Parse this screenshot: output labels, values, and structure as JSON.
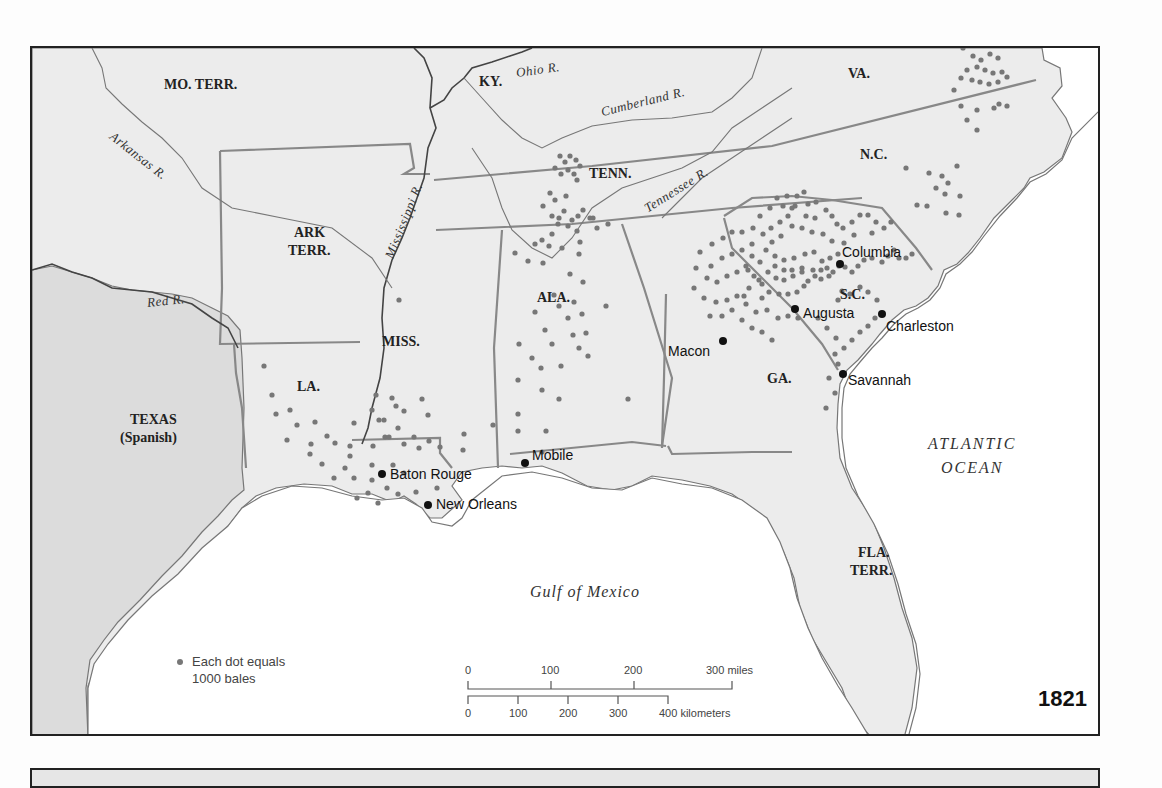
{
  "map": {
    "year": "1821",
    "legend": {
      "symbol": "dot",
      "line1": "Each dot equals",
      "line2": "1000 bales"
    },
    "scale": {
      "miles": {
        "ticks": [
          "0",
          "100",
          "200",
          "300 miles"
        ]
      },
      "kilometers": {
        "ticks": [
          "0",
          "100",
          "200",
          "300",
          "400 kilometers"
        ]
      }
    },
    "water_labels": {
      "atlantic_line1": "ATLANTIC",
      "atlantic_line2": "OCEAN",
      "gulf": "Gulf of Mexico"
    },
    "states": [
      {
        "id": "mo",
        "label": "MO. TERR.",
        "x": 132,
        "y": 28
      },
      {
        "id": "ky",
        "label": "KY.",
        "x": 447,
        "y": 25
      },
      {
        "id": "va",
        "label": "VA.",
        "x": 816,
        "y": 17
      },
      {
        "id": "tenn",
        "label": "TENN.",
        "x": 557,
        "y": 117
      },
      {
        "id": "nc",
        "label": "N.C.",
        "x": 828,
        "y": 98
      },
      {
        "id": "ark1",
        "label": "ARK",
        "x": 260,
        "y": 180
      },
      {
        "id": "ark2",
        "label": "TERR.",
        "x": 256,
        "y": 197
      },
      {
        "id": "ala",
        "label": "ALA.",
        "x": 505,
        "y": 241
      },
      {
        "id": "miss",
        "label": "MISS.",
        "x": 350,
        "y": 285
      },
      {
        "id": "sc",
        "label": "S.C.",
        "x": 808,
        "y": 238
      },
      {
        "id": "ga",
        "label": "GA.",
        "x": 735,
        "y": 322
      },
      {
        "id": "la",
        "label": "LA.",
        "x": 265,
        "y": 330
      },
      {
        "id": "tex1",
        "label": "TEXAS",
        "x": 98,
        "y": 367
      },
      {
        "id": "tex2",
        "label": "(Spanish)",
        "x": 90,
        "y": 385
      },
      {
        "id": "fla1",
        "label": "FLA.",
        "x": 824,
        "y": 498
      },
      {
        "id": "fla2",
        "label": "TERR.",
        "x": 818,
        "y": 516
      }
    ],
    "rivers": [
      {
        "id": "ohio",
        "label": "Ohio R.",
        "x": 484,
        "y": 16,
        "rot": -8
      },
      {
        "id": "cumberland",
        "label": "Cumberland R.",
        "x": 570,
        "y": 48,
        "rot": -14
      },
      {
        "id": "arkansas",
        "label": "Arkansas R.",
        "x": 74,
        "y": 98,
        "rot": 38
      },
      {
        "id": "mississippi",
        "label": "Mississippi R.",
        "x": 353,
        "y": 152,
        "rot": -68
      },
      {
        "id": "tennessee",
        "label": "Tennessee R.",
        "x": 612,
        "y": 130,
        "rot": -32
      },
      {
        "id": "red",
        "label": "Red R.",
        "x": 115,
        "y": 247,
        "rot": -6
      }
    ],
    "cities": [
      {
        "name": "Columbia",
        "cx": 808,
        "cy": 216,
        "lx": 812,
        "ly": 196
      },
      {
        "name": "Augusta",
        "cx": 763,
        "cy": 261,
        "lx": 771,
        "ly": 256
      },
      {
        "name": "Charleston",
        "cx": 850,
        "cy": 266,
        "lx": 854,
        "ly": 270
      },
      {
        "name": "Macon",
        "cx": 691,
        "cy": 293,
        "lx": 636,
        "ly": 295
      },
      {
        "name": "Savannah",
        "cx": 811,
        "cy": 326,
        "lx": 816,
        "ly": 326
      },
      {
        "name": "Mobile",
        "cx": 493,
        "cy": 415,
        "lx": 500,
        "ly": 399
      },
      {
        "name": "Baton Rouge",
        "cx": 350,
        "cy": 426,
        "lx": 358,
        "ly": 419
      },
      {
        "name": "New Orleans",
        "cx": 396,
        "cy": 457,
        "lx": 404,
        "ly": 449
      }
    ],
    "cotton_dots": [
      [
        931,
        0
      ],
      [
        941,
        8
      ],
      [
        949,
        12
      ],
      [
        958,
        6
      ],
      [
        966,
        10
      ],
      [
        935,
        22
      ],
      [
        945,
        19
      ],
      [
        953,
        22
      ],
      [
        961,
        25
      ],
      [
        970,
        24
      ],
      [
        929,
        30
      ],
      [
        940,
        32
      ],
      [
        948,
        34
      ],
      [
        957,
        36
      ],
      [
        966,
        34
      ],
      [
        975,
        29
      ],
      [
        922,
        42
      ],
      [
        929,
        58
      ],
      [
        945,
        62
      ],
      [
        962,
        60
      ],
      [
        975,
        58
      ],
      [
        935,
        72
      ],
      [
        945,
        82
      ],
      [
        967,
        56
      ],
      [
        874,
        120
      ],
      [
        897,
        125
      ],
      [
        910,
        128
      ],
      [
        916,
        135
      ],
      [
        925,
        118
      ],
      [
        904,
        140
      ],
      [
        895,
        158
      ],
      [
        913,
        146
      ],
      [
        914,
        165
      ],
      [
        928,
        148
      ],
      [
        885,
        157
      ],
      [
        927,
        167
      ],
      [
        528,
        108
      ],
      [
        533,
        114
      ],
      [
        538,
        108
      ],
      [
        544,
        112
      ],
      [
        536,
        122
      ],
      [
        542,
        126
      ],
      [
        523,
        120
      ],
      [
        529,
        126
      ],
      [
        548,
        118
      ],
      [
        545,
        132
      ],
      [
        518,
        145
      ],
      [
        523,
        152
      ],
      [
        534,
        148
      ],
      [
        511,
        158
      ],
      [
        520,
        168
      ],
      [
        527,
        170
      ],
      [
        532,
        163
      ],
      [
        540,
        172
      ],
      [
        546,
        168
      ],
      [
        551,
        162
      ],
      [
        558,
        170
      ],
      [
        536,
        178
      ],
      [
        526,
        176
      ],
      [
        545,
        183
      ],
      [
        520,
        186
      ],
      [
        510,
        192
      ],
      [
        503,
        196
      ],
      [
        517,
        198
      ],
      [
        530,
        200
      ],
      [
        547,
        206
      ],
      [
        561,
        170
      ],
      [
        576,
        176
      ],
      [
        565,
        180
      ],
      [
        548,
        194
      ],
      [
        737,
        244
      ],
      [
        744,
        230
      ],
      [
        752,
        232
      ],
      [
        761,
        228
      ],
      [
        770,
        224
      ],
      [
        776,
        233
      ],
      [
        747,
        246
      ],
      [
        756,
        246
      ],
      [
        765,
        244
      ],
      [
        772,
        238
      ],
      [
        783,
        228
      ],
      [
        789,
        231
      ],
      [
        795,
        220
      ],
      [
        801,
        224
      ],
      [
        807,
        218
      ],
      [
        813,
        219
      ],
      [
        820,
        224
      ],
      [
        826,
        218
      ],
      [
        832,
        212
      ],
      [
        840,
        210
      ],
      [
        850,
        214
      ],
      [
        856,
        208
      ],
      [
        862,
        202
      ],
      [
        867,
        210
      ],
      [
        874,
        210
      ],
      [
        880,
        206
      ],
      [
        810,
        243
      ],
      [
        818,
        246
      ],
      [
        828,
        239
      ],
      [
        836,
        244
      ],
      [
        845,
        252
      ],
      [
        806,
        252
      ],
      [
        763,
        158
      ],
      [
        774,
        168
      ],
      [
        783,
        170
      ],
      [
        794,
        162
      ],
      [
        800,
        168
      ],
      [
        805,
        176
      ],
      [
        811,
        180
      ],
      [
        820,
        174
      ],
      [
        828,
        167
      ],
      [
        836,
        167
      ],
      [
        844,
        174
      ],
      [
        852,
        180
      ],
      [
        859,
        174
      ],
      [
        840,
        185
      ],
      [
        822,
        187
      ],
      [
        812,
        195
      ],
      [
        800,
        193
      ],
      [
        791,
        186
      ],
      [
        780,
        184
      ],
      [
        770,
        180
      ],
      [
        760,
        178
      ],
      [
        749,
        188
      ],
      [
        740,
        194
      ],
      [
        734,
        202
      ],
      [
        743,
        208
      ],
      [
        752,
        212
      ],
      [
        762,
        210
      ],
      [
        773,
        206
      ],
      [
        782,
        204
      ],
      [
        790,
        213
      ],
      [
        798,
        210
      ],
      [
        806,
        206
      ],
      [
        781,
        222
      ],
      [
        789,
        222
      ],
      [
        797,
        228
      ],
      [
        770,
        220
      ],
      [
        760,
        222
      ],
      [
        752,
        222
      ],
      [
        743,
        218
      ],
      [
        736,
        224
      ],
      [
        728,
        214
      ],
      [
        720,
        208
      ],
      [
        716,
        222
      ],
      [
        727,
        232
      ],
      [
        717,
        240
      ],
      [
        730,
        250
      ],
      [
        712,
        248
      ],
      [
        664,
        220
      ],
      [
        675,
        230
      ],
      [
        685,
        234
      ],
      [
        695,
        228
      ],
      [
        705,
        224
      ],
      [
        714,
        218
      ],
      [
        722,
        228
      ],
      [
        730,
        236
      ],
      [
        679,
        218
      ],
      [
        690,
        210
      ],
      [
        700,
        206
      ],
      [
        710,
        202
      ],
      [
        720,
        196
      ],
      [
        668,
        204
      ],
      [
        680,
        196
      ],
      [
        691,
        190
      ],
      [
        700,
        184
      ],
      [
        710,
        184
      ],
      [
        721,
        180
      ],
      [
        731,
        186
      ],
      [
        739,
        180
      ],
      [
        748,
        174
      ],
      [
        756,
        168
      ],
      [
        728,
        168
      ],
      [
        738,
        160
      ],
      [
        745,
        150
      ],
      [
        755,
        148
      ],
      [
        765,
        148
      ],
      [
        772,
        144
      ],
      [
        784,
        154
      ],
      [
        776,
        156
      ],
      [
        760,
        160
      ],
      [
        751,
        158
      ],
      [
        662,
        240
      ],
      [
        672,
        250
      ],
      [
        684,
        254
      ],
      [
        695,
        252
      ],
      [
        705,
        248
      ],
      [
        714,
        256
      ],
      [
        724,
        264
      ],
      [
        735,
        262
      ],
      [
        746,
        270
      ],
      [
        756,
        268
      ],
      [
        766,
        270
      ],
      [
        678,
        268
      ],
      [
        690,
        268
      ],
      [
        700,
        262
      ],
      [
        710,
        272
      ],
      [
        720,
        280
      ],
      [
        730,
        284
      ],
      [
        740,
        292
      ],
      [
        786,
        270
      ],
      [
        795,
        280
      ],
      [
        804,
        290
      ],
      [
        812,
        300
      ],
      [
        820,
        292
      ],
      [
        828,
        284
      ],
      [
        836,
        278
      ],
      [
        843,
        270
      ],
      [
        803,
        306
      ],
      [
        806,
        316
      ],
      [
        797,
        330
      ],
      [
        803,
        345
      ],
      [
        794,
        360
      ],
      [
        367,
        252
      ],
      [
        483,
        205
      ],
      [
        496,
        213
      ],
      [
        511,
        215
      ],
      [
        522,
        247
      ],
      [
        538,
        226
      ],
      [
        551,
        234
      ],
      [
        542,
        254
      ],
      [
        527,
        258
      ],
      [
        536,
        270
      ],
      [
        550,
        266
      ],
      [
        503,
        264
      ],
      [
        513,
        282
      ],
      [
        541,
        287
      ],
      [
        554,
        285
      ],
      [
        487,
        296
      ],
      [
        500,
        310
      ],
      [
        520,
        296
      ],
      [
        547,
        300
      ],
      [
        556,
        308
      ],
      [
        509,
        320
      ],
      [
        529,
        318
      ],
      [
        574,
        258
      ],
      [
        486,
        332
      ],
      [
        510,
        342
      ],
      [
        527,
        351
      ],
      [
        596,
        351
      ],
      [
        486,
        366
      ],
      [
        486,
        383
      ],
      [
        514,
        383
      ],
      [
        510,
        404
      ],
      [
        344,
        347
      ],
      [
        360,
        350
      ],
      [
        340,
        362
      ],
      [
        347,
        372
      ],
      [
        364,
        358
      ],
      [
        372,
        363
      ],
      [
        390,
        351
      ],
      [
        396,
        367
      ],
      [
        353,
        389
      ],
      [
        352,
        372
      ],
      [
        366,
        380
      ],
      [
        357,
        389
      ],
      [
        372,
        396
      ],
      [
        382,
        389
      ],
      [
        397,
        393
      ],
      [
        341,
        398
      ],
      [
        387,
        400
      ],
      [
        408,
        399
      ],
      [
        432,
        386
      ],
      [
        461,
        377
      ],
      [
        431,
        402
      ],
      [
        340,
        417
      ],
      [
        361,
        417
      ],
      [
        372,
        425
      ],
      [
        355,
        440
      ],
      [
        366,
        446
      ],
      [
        384,
        444
      ],
      [
        405,
        440
      ],
      [
        340,
        432
      ],
      [
        322,
        430
      ],
      [
        325,
        450
      ],
      [
        336,
        445
      ],
      [
        346,
        455
      ],
      [
        232,
        318
      ],
      [
        240,
        347
      ],
      [
        244,
        366
      ],
      [
        258,
        362
      ],
      [
        265,
        377
      ],
      [
        255,
        392
      ],
      [
        279,
        396
      ],
      [
        283,
        374
      ],
      [
        278,
        406
      ],
      [
        290,
        416
      ],
      [
        302,
        430
      ],
      [
        313,
        420
      ],
      [
        318,
        408
      ],
      [
        303,
        395
      ],
      [
        295,
        388
      ],
      [
        318,
        398
      ],
      [
        322,
        375
      ]
    ]
  }
}
